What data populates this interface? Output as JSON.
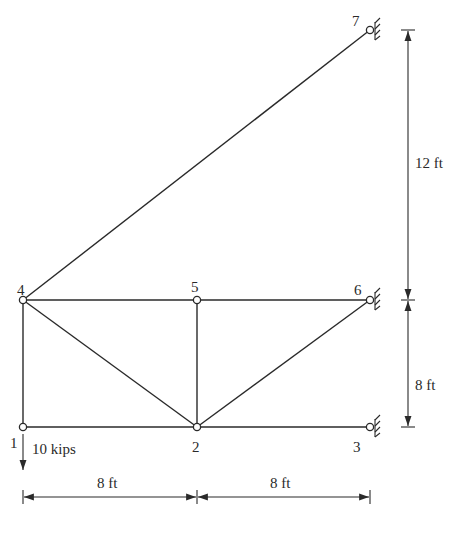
{
  "figure": {
    "type": "planar truss",
    "nodes": [
      {
        "id": "1",
        "label": "1",
        "x": 23,
        "y": 427,
        "support": "none"
      },
      {
        "id": "2",
        "label": "2",
        "x": 197,
        "y": 427,
        "support": "none"
      },
      {
        "id": "3",
        "label": "3",
        "x": 370,
        "y": 427,
        "support": "pin"
      },
      {
        "id": "4",
        "label": "4",
        "x": 23,
        "y": 300,
        "support": "none"
      },
      {
        "id": "5",
        "label": "5",
        "x": 197,
        "y": 300,
        "support": "none"
      },
      {
        "id": "6",
        "label": "6",
        "x": 370,
        "y": 300,
        "support": "pin"
      },
      {
        "id": "7",
        "label": "7",
        "x": 370,
        "y": 30,
        "support": "pin"
      }
    ],
    "members": [
      [
        "1",
        "2"
      ],
      [
        "2",
        "3"
      ],
      [
        "1",
        "4"
      ],
      [
        "4",
        "5"
      ],
      [
        "5",
        "6"
      ],
      [
        "4",
        "2"
      ],
      [
        "5",
        "2"
      ],
      [
        "2",
        "6"
      ],
      [
        "4",
        "7"
      ]
    ],
    "load": {
      "node": "1",
      "label": "10 kips",
      "direction": "down"
    },
    "dimensions": {
      "horizontal": [
        {
          "label": "8 ft",
          "from": "1",
          "to": "2"
        },
        {
          "label": "8 ft",
          "from": "2",
          "to": "3"
        }
      ],
      "vertical": [
        {
          "label": "12 ft",
          "from": "7",
          "to": "6"
        },
        {
          "label": "8 ft",
          "from": "6",
          "to": "3"
        }
      ]
    }
  }
}
